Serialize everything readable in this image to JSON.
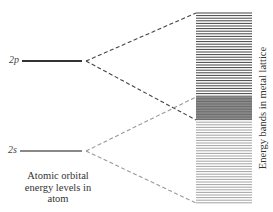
{
  "diagram": {
    "levels": [
      {
        "label": "2p",
        "y": 61,
        "x1": 22,
        "x2": 82,
        "color": "#333333",
        "width": 2
      },
      {
        "label": "2s",
        "y": 151,
        "x1": 20,
        "x2": 82,
        "color": "#888888",
        "width": 2
      }
    ],
    "caption_left": {
      "line1": "Atomic orbital",
      "line2": "energy levels in",
      "line3": "atom"
    },
    "caption_right": "Energy bands in metal lattice",
    "band_block": {
      "x": 196,
      "width": 56,
      "top": 13,
      "bottom": 203,
      "overlap_top": 97,
      "overlap_bottom": 120,
      "upper_line_color": "#444444",
      "lower_line_color": "#999999",
      "overlap_color": "#666666"
    },
    "connectors": [
      {
        "from": "2p",
        "to_y": 13,
        "color": "#444444"
      },
      {
        "from": "2p",
        "to_y": 120,
        "color": "#444444"
      },
      {
        "from": "2s",
        "to_y": 97,
        "color": "#999999"
      },
      {
        "from": "2s",
        "to_y": 203,
        "color": "#999999"
      }
    ]
  }
}
